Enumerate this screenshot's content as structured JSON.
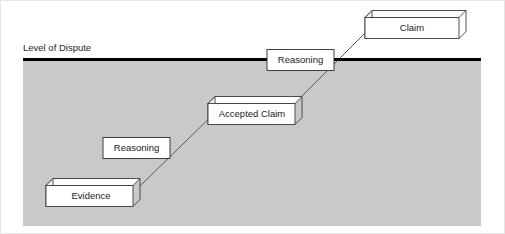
{
  "figure": {
    "title_label": "Level of Dispute",
    "background_color": "#ffffff",
    "dispute_region_color": "#c6c6c6",
    "dispute_line_color": "#000000",
    "box_fill_color": "#ffffff",
    "box_stroke_color": "#333333",
    "connector_color": "#555555",
    "frame_color": "#e2e2e2"
  },
  "nodes": [
    {
      "id": "evidence",
      "label": "Evidence",
      "style": "3d-block",
      "position": "bottom-left",
      "above_dispute_line": false
    },
    {
      "id": "reasoning-lower",
      "label": "Reasoning",
      "style": "flat-rectangle",
      "position": "lower-middle",
      "above_dispute_line": false
    },
    {
      "id": "accepted-claim",
      "label": "Accepted Claim",
      "style": "3d-block",
      "position": "center",
      "above_dispute_line": false
    },
    {
      "id": "reasoning-upper",
      "label": "Reasoning",
      "style": "flat-rectangle",
      "position": "upper-middle",
      "above_dispute_line": true
    },
    {
      "id": "claim",
      "label": "Claim",
      "style": "3d-block",
      "position": "top-right",
      "above_dispute_line": true
    }
  ],
  "connectors": [
    {
      "from": "evidence",
      "to": "accepted-claim"
    },
    {
      "from": "accepted-claim",
      "to": "claim"
    }
  ]
}
